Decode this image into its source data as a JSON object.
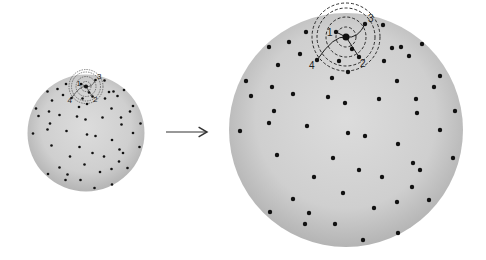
{
  "diagram": {
    "colors": {
      "sphere_center": "#dcdcdc",
      "sphere_edge": "#b4b4b4",
      "galaxy": "#111111",
      "lines": "#1a1a1a",
      "background": "#ffffff"
    },
    "large_sphere": {
      "cx": 346,
      "cy": 130,
      "r": 117
    },
    "small_sphere": {
      "cx": 86,
      "cy": 133,
      "r": 58,
      "scale": 0.5
    },
    "arrow": {
      "x1": 166,
      "y1": 132,
      "x2": 208,
      "y2": 132
    },
    "reference_galaxy": {
      "x": 346,
      "y": 37
    },
    "numbered_galaxies": [
      {
        "label": "1",
        "x": 336,
        "y": 32,
        "label_dx": -9,
        "label_dy": 4
      },
      {
        "label": "2",
        "x": 359,
        "y": 57,
        "label_dx": 1,
        "label_dy": 10
      },
      {
        "label": "3",
        "x": 365,
        "y": 24,
        "label_dx": 3,
        "label_dy": -2
      },
      {
        "label": "4",
        "x": 317,
        "y": 60,
        "label_dx": -8,
        "label_dy": 9
      }
    ],
    "dashed_rings": [
      10,
      20,
      29,
      34
    ],
    "galaxies": [
      [
        306,
        32
      ],
      [
        383,
        25
      ],
      [
        289,
        42
      ],
      [
        269,
        47
      ],
      [
        422,
        44
      ],
      [
        392,
        48
      ],
      [
        401,
        47
      ],
      [
        300,
        54
      ],
      [
        409,
        56
      ],
      [
        278,
        65
      ],
      [
        384,
        61
      ],
      [
        348,
        72
      ],
      [
        332,
        78
      ],
      [
        440,
        76
      ],
      [
        246,
        81
      ],
      [
        397,
        81
      ],
      [
        272,
        87
      ],
      [
        434,
        87
      ],
      [
        293,
        94
      ],
      [
        251,
        96
      ],
      [
        328,
        97
      ],
      [
        379,
        99
      ],
      [
        416,
        99
      ],
      [
        345,
        103
      ],
      [
        274,
        111
      ],
      [
        417,
        113
      ],
      [
        455,
        111
      ],
      [
        269,
        123
      ],
      [
        307,
        126
      ],
      [
        240,
        131
      ],
      [
        440,
        130
      ],
      [
        348,
        133
      ],
      [
        365,
        136
      ],
      [
        398,
        144
      ],
      [
        277,
        155
      ],
      [
        333,
        158
      ],
      [
        453,
        158
      ],
      [
        413,
        163
      ],
      [
        420,
        170
      ],
      [
        359,
        170
      ],
      [
        314,
        177
      ],
      [
        382,
        177
      ],
      [
        412,
        187
      ],
      [
        343,
        193
      ],
      [
        293,
        199
      ],
      [
        429,
        200
      ],
      [
        397,
        202
      ],
      [
        374,
        208
      ],
      [
        270,
        212
      ],
      [
        309,
        213
      ],
      [
        305,
        224
      ],
      [
        335,
        224
      ],
      [
        398,
        233
      ],
      [
        363,
        240
      ],
      [
        352,
        49
      ],
      [
        339,
        61
      ]
    ]
  }
}
